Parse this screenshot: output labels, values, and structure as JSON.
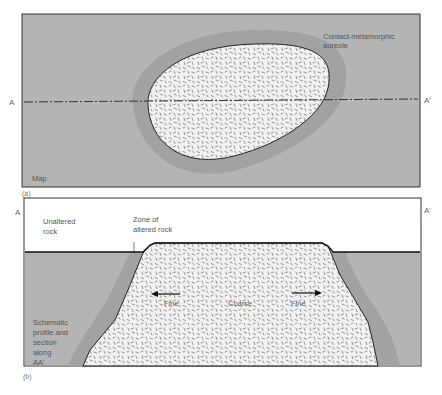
{
  "figure": {
    "panel_a": {
      "tag": "(a)",
      "corner_label": "Map",
      "aureole_label_line1": "Contact-metamorphic",
      "aureole_label_line2": "aureole",
      "line_start": "A",
      "line_end": "A'"
    },
    "panel_b": {
      "tag": "(b)",
      "line_start": "A",
      "line_end": "A'",
      "unaltered_line1": "Unaltered",
      "unaltered_line2": "rock",
      "zone_line1": "Zone of",
      "zone_line2": "altered rock",
      "fine_left": "Fine",
      "coarse": "Coarse",
      "fine_right": "Fine",
      "caption_line1": "Schematic",
      "caption_line2": "profile and",
      "caption_line3": "section",
      "caption_line4": "along",
      "caption_line5": "AA'"
    },
    "colors": {
      "country_rock": "#b4b4b4",
      "aureole": "#a0a0a0",
      "pluton": "#f2f2f2",
      "outline": "#222222",
      "sky": "#ffffff"
    }
  }
}
